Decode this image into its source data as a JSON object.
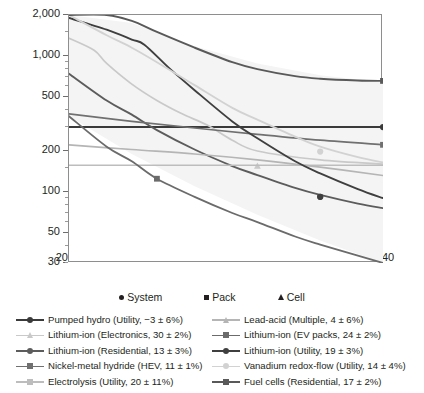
{
  "chart_data": {
    "type": "line",
    "title": "",
    "xlabel": "",
    "ylabel": "Product Price (USD/kWh",
    "ylabel_sub": "cap",
    "ylabel_suffix": ")",
    "xlim": [
      2015,
      2040
    ],
    "ylim": [
      30,
      2000
    ],
    "yscale": "log",
    "grid": false,
    "legend_position": "below",
    "x_ticks": [
      "2015",
      "2020",
      "2025",
      "2030",
      "2035",
      "2040"
    ],
    "x_tick_values": [
      2015,
      2020,
      2025,
      2030,
      2035,
      2040
    ],
    "y_ticks": [
      "2,000",
      "1,000",
      "500",
      "200",
      "100",
      "50",
      "30"
    ],
    "y_tick_values": [
      2000,
      1000,
      500,
      200,
      100,
      50,
      30
    ],
    "uncertainty_band": {
      "fill": "#f4f4f4",
      "upper_x": [
        2015,
        2020,
        2025,
        2030,
        2035,
        2040
      ],
      "upper_y": [
        2000,
        1750,
        1180,
        880,
        720,
        640
      ],
      "lower_x": [
        2015,
        2020,
        2025,
        2030,
        2035,
        2040
      ],
      "lower_y": [
        360,
        190,
        110,
        68,
        44,
        30
      ]
    },
    "marker_legend": [
      {
        "name": "system-marker",
        "shape": "circle",
        "label": "System"
      },
      {
        "name": "pack-marker",
        "shape": "square",
        "label": "Pack"
      },
      {
        "name": "cell-marker",
        "shape": "triangle",
        "label": "Cell"
      }
    ],
    "series": [
      {
        "name": "Pumped hydro (Utility, −3 ± 6%)",
        "key": "pumped-hydro",
        "color": "#3a3a3a",
        "width": 1.9,
        "marker": "circle",
        "x": [
          2015,
          2020,
          2025,
          2030,
          2035,
          2040
        ],
        "values": [
          300,
          300,
          300,
          300,
          300,
          300
        ],
        "marker_points": [
          {
            "x": 2040,
            "y": 300
          }
        ]
      },
      {
        "name": "Lithium-ion (Electronics, 30 ± 2%)",
        "key": "liion-electronics",
        "color": "#c9c9c9",
        "width": 1.7,
        "marker": "triangle",
        "x": [
          2015,
          2017,
          2018,
          2020,
          2022,
          2024,
          2026,
          2028,
          2030,
          2035,
          2040
        ],
        "values": [
          1350,
          1100,
          880,
          620,
          470,
          375,
          310,
          240,
          200,
          172,
          160
        ],
        "marker_points": [
          {
            "x": 2030,
            "y": 155
          }
        ]
      },
      {
        "name": "Lithium-ion (Residential, 13 ± 3%)",
        "key": "liion-residential",
        "color": "#5c5c5c",
        "width": 1.9,
        "marker": "circle",
        "x": [
          2015,
          2018,
          2020,
          2022,
          2025,
          2028,
          2030,
          2033,
          2035,
          2038,
          2040
        ],
        "values": [
          740,
          470,
          370,
          285,
          205,
          155,
          133,
          107,
          95,
          82,
          76
        ],
        "marker_points": [
          {
            "x": 2035,
            "y": 92
          }
        ]
      },
      {
        "name": "Nickel-metal hydride (HEV, 11 ± 1%)",
        "key": "nimh-hev",
        "color": "#707070",
        "width": 1.7,
        "marker": "square",
        "x": [
          2015,
          2020,
          2025,
          2030,
          2035,
          2040
        ],
        "values": [
          375,
          330,
          295,
          265,
          240,
          222
        ],
        "marker_points": [
          {
            "x": 2040,
            "y": 222
          }
        ]
      },
      {
        "name": "Electrolysis (Utility, 20 ± 11%)",
        "key": "electrolysis-utility",
        "color": "#bdbdbd",
        "width": 1.7,
        "marker": "square",
        "x": [
          2015,
          2020,
          2025,
          2030,
          2035,
          2040
        ],
        "values": [
          157,
          157,
          157,
          157,
          157,
          157
        ],
        "marker_points": []
      },
      {
        "name": "Lead-acid (Multiple, 4 ± 6%)",
        "key": "lead-acid",
        "color": "#b5b5b5",
        "width": 1.7,
        "marker": "triangle",
        "x": [
          2015,
          2020,
          2025,
          2030,
          2035,
          2040
        ],
        "values": [
          222,
          205,
          190,
          172,
          152,
          132
        ],
        "marker_points": []
      },
      {
        "name": "Lithium-ion (EV packs, 24 ± 2%)",
        "key": "liion-ev-packs",
        "color": "#6b6b6b",
        "width": 1.8,
        "marker": "square",
        "x": [
          2015,
          2018,
          2020,
          2022,
          2025,
          2028,
          2030,
          2033,
          2035,
          2038,
          2040
        ],
        "values": [
          360,
          215,
          168,
          125,
          92,
          70,
          60,
          47,
          41,
          34,
          30
        ],
        "marker_points": [
          {
            "x": 2022,
            "y": 125
          }
        ]
      },
      {
        "name": "Lithium-ion (Utility, 19 ± 3%)",
        "key": "liion-utility",
        "color": "#3f3f3f",
        "width": 1.9,
        "marker": "circle",
        "x": [
          2015,
          2018,
          2020,
          2021,
          2023,
          2025,
          2028,
          2030,
          2033,
          2035,
          2038,
          2040
        ],
        "values": [
          1900,
          1560,
          1320,
          1210,
          810,
          560,
          330,
          248,
          168,
          137,
          105,
          90
        ],
        "marker_points": [
          {
            "x": 2035,
            "y": 92
          }
        ]
      },
      {
        "name": "Vanadium redox-flow (Utility, 14 ± 4%)",
        "key": "vanadium-redox-flow",
        "color": "#d2d2d2",
        "width": 1.8,
        "marker": "circle",
        "x": [
          2015,
          2018,
          2020,
          2022,
          2025,
          2028,
          2030,
          2033,
          2035,
          2038,
          2040
        ],
        "values": [
          2000,
          1420,
          1150,
          900,
          610,
          415,
          340,
          255,
          215,
          180,
          165
        ],
        "marker_points": [
          {
            "x": 2035,
            "y": 198
          }
        ]
      },
      {
        "name": "Fuel cells (Residential, 17 ± 2%)",
        "key": "fuel-cells-residential",
        "color": "#595959",
        "width": 1.9,
        "marker": "square",
        "x": [
          2015,
          2018,
          2020,
          2022,
          2025,
          2028,
          2030,
          2033,
          2035,
          2038,
          2040
        ],
        "values": [
          2000,
          2000,
          1810,
          1500,
          1150,
          900,
          800,
          710,
          680,
          660,
          655
        ],
        "marker_points": [
          {
            "x": 2040,
            "y": 655
          }
        ]
      }
    ]
  },
  "legend": {
    "col_left": [
      {
        "key": "pumped-hydro",
        "label": "Pumped hydro (Utility, −3 ± 6%)",
        "color": "#3a3a3a",
        "marker": "circle"
      },
      {
        "key": "liion-electronics",
        "label": "Lithium-ion (Electronics, 30 ± 2%)",
        "color": "#c9c9c9",
        "marker": "triangle"
      },
      {
        "key": "liion-residential",
        "label": "Lithium-ion (Residential, 13 ± 3%)",
        "color": "#5c5c5c",
        "marker": "circle"
      },
      {
        "key": "nimh-hev",
        "label": "Nickel-metal hydride (HEV, 11 ± 1%)",
        "color": "#707070",
        "marker": "square"
      },
      {
        "key": "electrolysis-utility",
        "label": "Electrolysis (Utility, 20 ± 11%)",
        "color": "#bdbdbd",
        "marker": "square"
      }
    ],
    "col_right": [
      {
        "key": "lead-acid",
        "label": "Lead-acid (Multiple, 4 ± 6%)",
        "color": "#b5b5b5",
        "marker": "triangle"
      },
      {
        "key": "liion-ev-packs",
        "label": "Lithium-ion (EV packs, 24 ± 2%)",
        "color": "#6b6b6b",
        "marker": "square"
      },
      {
        "key": "liion-utility",
        "label": "Lithium-ion (Utility, 19 ± 3%)",
        "color": "#3f3f3f",
        "marker": "circle"
      },
      {
        "key": "vanadium-redox-flow",
        "label": "Vanadium redox-flow (Utility, 14 ± 4%)",
        "color": "#d2d2d2",
        "marker": "circle"
      },
      {
        "key": "fuel-cells-residential",
        "label": "Fuel cells (Residential, 17 ± 2%)",
        "color": "#595959",
        "marker": "square"
      }
    ]
  },
  "colors": {
    "axis": "#8e8e8e",
    "tick": "#6d6d6d",
    "text": "#231f20",
    "band_fill": "#f4f4f4"
  }
}
